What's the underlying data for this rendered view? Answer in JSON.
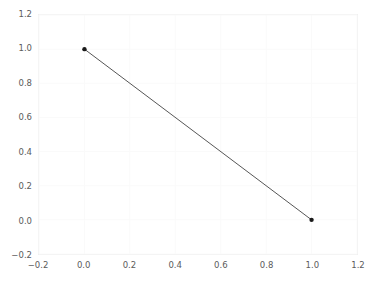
{
  "chart_data": {
    "type": "line",
    "title": "",
    "xlabel": "",
    "ylabel": "",
    "xlim": [
      -0.2,
      1.2
    ],
    "ylim": [
      -0.2,
      1.2
    ],
    "grid": true,
    "legend": false,
    "legend_position": "none",
    "xticks": [
      "−0.2",
      "0.0",
      "0.2",
      "0.4",
      "0.6",
      "0.8",
      "1.0",
      "1.2"
    ],
    "xtick_values": [
      -0.2,
      0.0,
      0.2,
      0.4,
      0.6,
      0.8,
      1.0,
      1.2
    ],
    "yticks": [
      "−0.2",
      "0.0",
      "0.2",
      "0.4",
      "0.6",
      "0.8",
      "1.0",
      "1.2"
    ],
    "ytick_values": [
      -0.2,
      0.0,
      0.2,
      0.4,
      0.6,
      0.8,
      1.0,
      1.2
    ],
    "series": [
      {
        "name": "line-1",
        "x": [
          0.0,
          1.0
        ],
        "y": [
          1.0,
          0.0
        ],
        "color": "#555555",
        "marker": "o",
        "marker_color": "#1a1a1a",
        "linewidth": 1
      }
    ],
    "colors": {
      "background": "#ffffff",
      "grid": "#fafafa",
      "spine": "#f0f0f0",
      "tick_text": "#5b5b5b",
      "line": "#555555",
      "marker": "#1a1a1a"
    }
  }
}
